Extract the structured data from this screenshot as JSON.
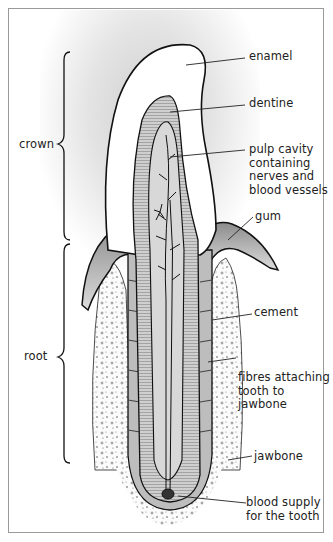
{
  "regions": {
    "crown": "crown",
    "root": "root"
  },
  "labels": {
    "enamel": "enamel",
    "dentine": "dentine",
    "pulp": [
      "pulp cavity",
      "containing",
      "nerves and",
      "blood vessels"
    ],
    "gum": "gum",
    "cement": "cement",
    "fibres": [
      "fibres attaching",
      "tooth to",
      "jawbone"
    ],
    "jawbone": "jawbone",
    "blood": [
      "blood supply",
      "for the tooth"
    ]
  },
  "colors": {
    "outline": "#111111",
    "enamel": "#ffffff",
    "dentine": "#c9c9c9",
    "pulp": "#d8d8d8",
    "gum": "#9a9a9a",
    "bone": "#f4f4f4",
    "background_shade": "#dcdcdc"
  }
}
